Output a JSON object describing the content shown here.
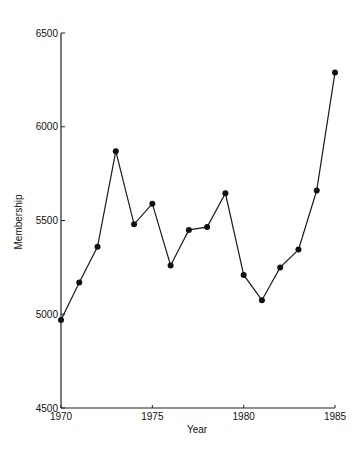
{
  "chart_data": {
    "type": "line",
    "title": "",
    "xlabel": "Year",
    "ylabel": "Membership",
    "xlim": [
      1970,
      1985
    ],
    "ylim": [
      4500,
      6500
    ],
    "x_ticks": [
      1970,
      1975,
      1980,
      1985
    ],
    "x_tick_labels": [
      "1970",
      "1975",
      "1980",
      "1985"
    ],
    "y_ticks": [
      4500,
      5000,
      5500,
      6000,
      6500
    ],
    "y_tick_labels": [
      "4500",
      "5000",
      "5500",
      "6000",
      "6500"
    ],
    "grid": false,
    "legend": null,
    "markers": "filled-circle",
    "series": [
      {
        "name": "Membership",
        "x": [
          1970,
          1971,
          1972,
          1973,
          1974,
          1975,
          1976,
          1977,
          1978,
          1979,
          1980,
          1981,
          1982,
          1983,
          1984,
          1985
        ],
        "values": [
          4970,
          5170,
          5360,
          5870,
          5480,
          5590,
          5260,
          5450,
          5465,
          5645,
          5210,
          5075,
          5250,
          5345,
          5660,
          6290
        ]
      }
    ]
  },
  "colors": {
    "line": "#1a1a1a",
    "marker": "#111111",
    "axis": "#222222",
    "background": "#ffffff"
  }
}
